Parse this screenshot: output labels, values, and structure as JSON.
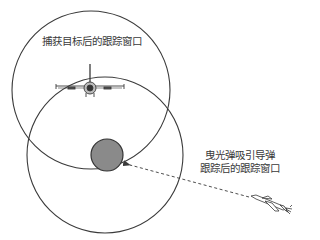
{
  "diagram": {
    "title": "",
    "labels": {
      "acquired_window": "捕获目标后的跟踪窗口",
      "decoy_window_line1": "曳光弹吸引导弹",
      "decoy_window_line2": "跟踪后的跟踪窗口"
    },
    "elements": {
      "acquired_circle": {
        "cx": 91,
        "cy": 90,
        "r": 79,
        "stroke": "#3a3a3a"
      },
      "decoy_circle": {
        "cx": 105,
        "cy": 155,
        "r": 78,
        "stroke": "#3a3a3a"
      },
      "flare": {
        "cx": 107,
        "cy": 155,
        "r": 16,
        "fill": "#8a8a8a",
        "stroke": "#333333"
      },
      "target_aircraft": {
        "x": 90,
        "y": 88
      },
      "missile": {
        "x": 265,
        "y": 208
      },
      "tracking_arrow": {
        "from": [
          250,
          198
        ],
        "to": [
          128,
          165
        ],
        "style": "dashed"
      }
    },
    "colors": {
      "line": "#3a3a3a",
      "flare_fill": "#8a8a8a",
      "background": "#ffffff"
    }
  }
}
